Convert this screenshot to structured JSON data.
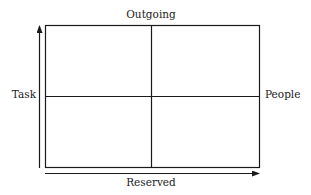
{
  "diagram": {
    "type": "quadrant-matrix",
    "labels": {
      "top": "Outgoing",
      "bottom": "Reserved",
      "left": "Task",
      "right": "People"
    },
    "quadrants": 4,
    "axes": {
      "vertical_arrow": "up",
      "horizontal_arrow": "right"
    },
    "colors": {
      "line": "#1a1a1a",
      "text": "#222222",
      "background": "#ffffff"
    }
  }
}
